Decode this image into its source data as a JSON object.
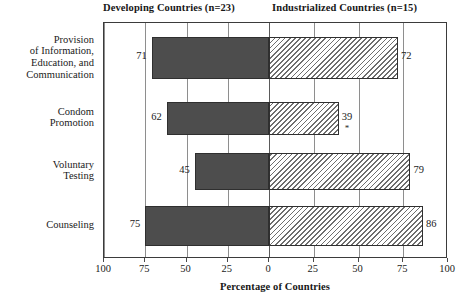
{
  "headings": {
    "left_group": "Developing Countries (n=23)",
    "right_group": "Industrialized Countries (n=15)"
  },
  "axis": {
    "title": "Percentage of Countries",
    "tick_labels": [
      "100",
      "75",
      "50",
      "25",
      "0",
      "25",
      "50",
      "75",
      "100"
    ]
  },
  "categories": [
    "Provision\nof Information,\nEducation, and\nCommunication",
    "Condom\nPromotion",
    "Voluntary\nTesting",
    "Counseling"
  ],
  "category_lines": [
    [
      "Provision",
      "of Information,",
      "Education, and",
      "Communication"
    ],
    [
      "Condom",
      "Promotion"
    ],
    [
      "Voluntary",
      "Testing"
    ],
    [
      "Counseling"
    ]
  ],
  "values": {
    "developing": [
      "71",
      "62",
      "45",
      "75"
    ],
    "industrialized": [
      "72",
      "39",
      "79",
      "86"
    ]
  },
  "footnote_marks": {
    "row2_industrialized": "*"
  },
  "colors": {
    "developing_fill": "#4d4d4d",
    "industrialized_fill": "#ffffff",
    "hatch_stroke": "#6e6e6e",
    "frame": "#3b3b3b",
    "gridline": "#8e8e8e",
    "text": "#1a1a1a"
  },
  "chart_data": {
    "type": "bar",
    "orientation": "horizontal",
    "layout": "back-to-back (diverging) paired horizontal bars, shared zero at center",
    "title": "",
    "xlabel": "Percentage of Countries",
    "ylabel": "",
    "categories": [
      "Provision of Information, Education, and Communication",
      "Condom Promotion",
      "Voluntary Testing",
      "Counseling"
    ],
    "series": [
      {
        "name": "Developing Countries (n=23)",
        "direction": "left",
        "style": "solid dark gray fill",
        "values": [
          71,
          62,
          45,
          75
        ]
      },
      {
        "name": "Industrialized Countries (n=15)",
        "direction": "right",
        "style": "diagonal hatch fill",
        "values": [
          72,
          39,
          79,
          86
        ]
      }
    ],
    "data_labels": {
      "developing": [
        71,
        62,
        45,
        75
      ],
      "industrialized": [
        72,
        39,
        79,
        86
      ]
    },
    "annotations": [
      {
        "text": "*",
        "attached_to": "Industrialized: Condom Promotion (39)"
      }
    ],
    "xlim_left": [
      0,
      100
    ],
    "xlim_right": [
      0,
      100
    ],
    "xticks": [
      100,
      75,
      50,
      25,
      0,
      25,
      50,
      75,
      100
    ],
    "grid": "vertical gridlines at every 25 units",
    "legend_position": "top (group headings above plot area)",
    "units": "percent"
  }
}
